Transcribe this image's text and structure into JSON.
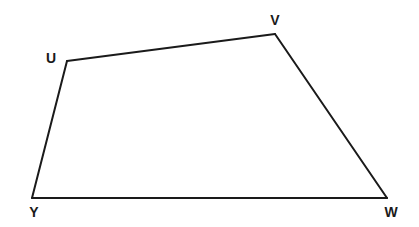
{
  "diagram": {
    "type": "quadrilateral",
    "stroke_color": "#1a1a1a",
    "background": "#ffffff",
    "vertices": [
      {
        "name": "U",
        "x": 67,
        "y": 61,
        "label_x": 51,
        "label_y": 59
      },
      {
        "name": "V",
        "x": 275,
        "y": 34,
        "label_x": 275,
        "label_y": 21
      },
      {
        "name": "W",
        "x": 387,
        "y": 198,
        "label_x": 391,
        "label_y": 213
      },
      {
        "name": "Y",
        "x": 32,
        "y": 198,
        "label_x": 34,
        "label_y": 213
      }
    ],
    "edges": [
      {
        "name": "UV",
        "from": "U",
        "to": "V"
      },
      {
        "name": "VW",
        "from": "V",
        "to": "W"
      },
      {
        "name": "WY",
        "from": "W",
        "to": "Y"
      },
      {
        "name": "YU",
        "from": "Y",
        "to": "U"
      }
    ]
  }
}
